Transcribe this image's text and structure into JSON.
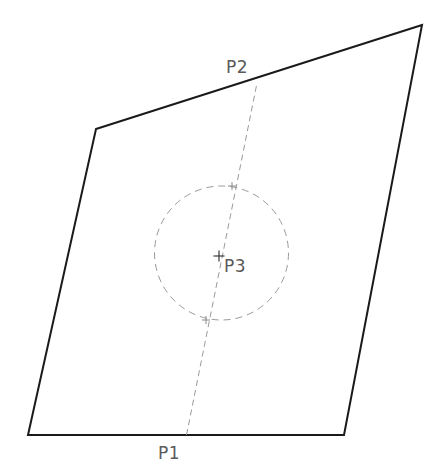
{
  "canvas": {
    "width": 436,
    "height": 476,
    "background": "#ffffff",
    "title": "Quadrilateral with inscribed dashed circle and construction line"
  },
  "style": {
    "outline_color": "#1a1a1a",
    "outline_width": 2,
    "construction_color": "#9a9a9a",
    "construction_width": 1,
    "circle_color": "#9a9a9a",
    "circle_width": 1,
    "label_color": "#5a5a5a",
    "label_font_size": 17,
    "dash_pattern_line": "6,4",
    "dash_pattern_circle": "7,5"
  },
  "shapes": {
    "quadrilateral": {
      "name": "outer-quadrilateral",
      "points": [
        {
          "id": "top-left",
          "x": 96,
          "y": 129
        },
        {
          "id": "top-right",
          "x": 422,
          "y": 25
        },
        {
          "id": "bottom-right",
          "x": 344,
          "y": 435
        },
        {
          "id": "bottom-left",
          "x": 28,
          "y": 435
        }
      ],
      "closed": true,
      "points_string": "96,129 422,25 344,435 28,435"
    },
    "circle": {
      "name": "dashed-circle",
      "cx": 221.5,
      "cy": 253,
      "r": 67,
      "fill": "none"
    },
    "construction_line": {
      "name": "dashed-construction-line",
      "x1": 186.5,
      "y1": 435,
      "x2": 257,
      "y2": 83
    }
  },
  "markers": [
    {
      "id": "p3-center-marker",
      "x": 219,
      "y": 256,
      "size": 11,
      "stroke": "#3a3a3a",
      "width": 1.2
    },
    {
      "id": "circle-top-intersection-marker",
      "x": 232,
      "y": 186,
      "size": 8,
      "stroke": "#8a8a8a",
      "width": 1
    },
    {
      "id": "circle-bottom-intersection-marker",
      "x": 206,
      "y": 320,
      "size": 8,
      "stroke": "#8a8a8a",
      "width": 1
    }
  ],
  "labels": [
    {
      "id": "p1",
      "text": "P1",
      "x": 158,
      "y": 459,
      "anchor": "start"
    },
    {
      "id": "p2",
      "text": "P2",
      "x": 226,
      "y": 73,
      "anchor": "start"
    },
    {
      "id": "p3",
      "text": "P3",
      "x": 224,
      "y": 272,
      "anchor": "start"
    }
  ]
}
